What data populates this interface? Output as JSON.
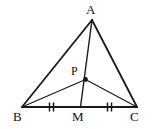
{
  "figure": {
    "background_color": "#ffffff",
    "stroke_color": "#1a1a1a",
    "label_color": "#111111",
    "width": 154,
    "height": 129,
    "labels": {
      "A": "A",
      "B": "B",
      "C": "C",
      "M": "M",
      "P": "P"
    },
    "points": {
      "A": {
        "x": 92,
        "y": 20
      },
      "B": {
        "x": 22,
        "y": 107
      },
      "C": {
        "x": 137,
        "y": 107
      },
      "M": {
        "x": 80.5,
        "y": 107
      },
      "P": {
        "x": 85.5,
        "y": 79.5
      }
    },
    "segments": [
      {
        "name": "side-AB",
        "from": "A",
        "to": "B",
        "width": 1.8
      },
      {
        "name": "side-AC",
        "from": "A",
        "to": "C",
        "width": 1.8
      },
      {
        "name": "side-BC",
        "from": "B",
        "to": "C",
        "width": 1.8
      },
      {
        "name": "cevian-AM",
        "from": "A",
        "to": "M",
        "width": 1.4
      },
      {
        "name": "segment-BP",
        "from": "B",
        "to": "P",
        "width": 1.2
      },
      {
        "name": "segment-PC",
        "from": "P",
        "to": "C",
        "width": 1.2
      }
    ],
    "tick_marks": [
      {
        "name": "congruence-tick-BM",
        "segment": "BM",
        "center_x": 52,
        "center_y": 107,
        "count": 2
      },
      {
        "name": "congruence-tick-MC",
        "segment": "MC",
        "center_x": 110,
        "center_y": 107,
        "count": 2
      }
    ],
    "point_marker": {
      "name": "point-P-dot",
      "x": 85.5,
      "y": 79.5,
      "radius": 2.4
    }
  }
}
